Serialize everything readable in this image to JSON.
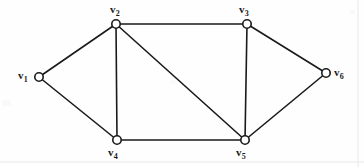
{
  "figure": {
    "type": "undirected-graph-diagram",
    "width": 364,
    "height": 167,
    "background_color": "#fefefe",
    "stroke_color": "#1a1a1a",
    "vertex_fill_color": "#ffffff",
    "vertex_radius": 4.2,
    "edge_width": 1.6
  },
  "vertices": [
    {
      "id": "v1",
      "base": "v",
      "sub": "1",
      "cx": 39,
      "cy": 77,
      "label_x": 18,
      "label_y": 70,
      "label_anchor": "left"
    },
    {
      "id": "v2",
      "base": "v",
      "sub": "2",
      "cx": 116,
      "cy": 24,
      "label_x": 110,
      "label_y": 4,
      "label_anchor": "top"
    },
    {
      "id": "v3",
      "base": "v",
      "sub": "3",
      "cx": 247,
      "cy": 24,
      "label_x": 239,
      "label_y": 4,
      "label_anchor": "top"
    },
    {
      "id": "v4",
      "base": "v",
      "sub": "4",
      "cx": 117,
      "cy": 140,
      "label_x": 108,
      "label_y": 147,
      "label_anchor": "bottom"
    },
    {
      "id": "v5",
      "base": "v",
      "sub": "5",
      "cx": 245,
      "cy": 140,
      "label_x": 236,
      "label_y": 147,
      "label_anchor": "bottom"
    },
    {
      "id": "v6",
      "base": "v",
      "sub": "6",
      "cx": 326,
      "cy": 73,
      "label_x": 334,
      "label_y": 67,
      "label_anchor": "right"
    }
  ],
  "edges": [
    {
      "from": "v1",
      "to": "v2"
    },
    {
      "from": "v1",
      "to": "v4"
    },
    {
      "from": "v2",
      "to": "v3"
    },
    {
      "from": "v2",
      "to": "v4"
    },
    {
      "from": "v2",
      "to": "v5"
    },
    {
      "from": "v3",
      "to": "v5"
    },
    {
      "from": "v3",
      "to": "v6"
    },
    {
      "from": "v4",
      "to": "v5"
    },
    {
      "from": "v5",
      "to": "v6"
    }
  ],
  "frame_marks": {
    "right_rule_x": 358,
    "bottom_rule_y": 162,
    "rule_color": "#e8e8e6"
  }
}
